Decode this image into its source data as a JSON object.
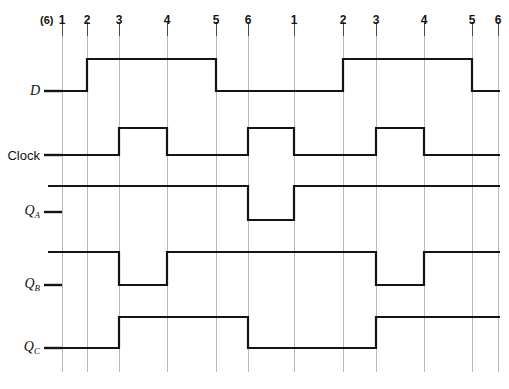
{
  "figure": {
    "width": 509,
    "height": 389,
    "background": "#ffffff",
    "wave_color": "#141414",
    "grid_color": "#b9b9b9",
    "label_color": "#141414"
  },
  "axis": {
    "prefix_label": "(6)",
    "prefix_x": 40,
    "label_y": 14,
    "tick_top": 22,
    "tick_bottom": 36,
    "grid_top": 22,
    "grid_bottom": 372,
    "ticks": [
      {
        "label": "1",
        "x": 62
      },
      {
        "label": "2",
        "x": 87
      },
      {
        "label": "3",
        "x": 119
      },
      {
        "label": "4",
        "x": 167
      },
      {
        "label": "5",
        "x": 216
      },
      {
        "label": "6",
        "x": 248
      },
      {
        "label": "1",
        "x": 294
      },
      {
        "label": "2",
        "x": 343
      },
      {
        "label": "3",
        "x": 376
      },
      {
        "label": "4",
        "x": 424
      },
      {
        "label": "5",
        "x": 472
      },
      {
        "label": "6",
        "x": 498
      }
    ]
  },
  "signals": [
    {
      "name": "D",
      "label": "D",
      "sub": "",
      "italic": true,
      "label_x": 40,
      "label_y": 91,
      "lead": {
        "x1": 44,
        "x2": 62,
        "y": 91
      },
      "high_y": 59,
      "low_y": 91,
      "points": "62,91 87,91 87,59 216,59 216,91 343,91 343,59 472,59 472,91 500,91"
    },
    {
      "name": "Clock",
      "label": "Clock",
      "sub": "",
      "italic": false,
      "label_x": 40,
      "label_y": 155,
      "lead": {
        "x1": 44,
        "x2": 62,
        "y": 155
      },
      "high_y": 128,
      "low_y": 155,
      "points": "62,155 119,155 119,128 167,128 167,155 248,155 248,128 294,128 294,155 376,155 376,128 424,128 424,155 500,155"
    },
    {
      "name": "QA",
      "label": "Q",
      "sub": "A",
      "italic": true,
      "label_x": 40,
      "label_y": 212,
      "lead": {
        "x1": 44,
        "x2": 62,
        "y": 212
      },
      "high_y": 186,
      "low_y": 220,
      "points": "48,186 248,186 248,220 294,220 294,186 500,186"
    },
    {
      "name": "QB",
      "label": "Q",
      "sub": "B",
      "italic": true,
      "label_x": 40,
      "label_y": 285,
      "lead": {
        "x1": 44,
        "x2": 62,
        "y": 285
      },
      "high_y": 252,
      "low_y": 285,
      "points": "48,252 119,252 119,285 167,285 167,252 376,252 376,285 424,285 424,252 500,252"
    },
    {
      "name": "QC",
      "label": "Q",
      "sub": "C",
      "italic": true,
      "label_x": 40,
      "label_y": 348,
      "lead": {
        "x1": 44,
        "x2": 62,
        "y": 348
      },
      "high_y": 317,
      "low_y": 348,
      "points": "48,348 119,348 119,317 248,317 248,348 376,348 376,317 500,317"
    }
  ]
}
